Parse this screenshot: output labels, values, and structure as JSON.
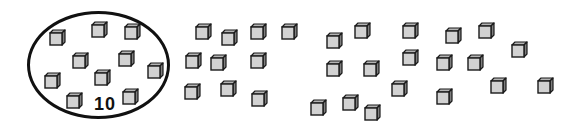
{
  "worksheet": {
    "group": {
      "label": "10",
      "ellipse": {
        "x": 27,
        "y": 11,
        "w": 143,
        "h": 108
      },
      "label_pos": {
        "x": 94,
        "y": 95
      },
      "cubes": [
        {
          "x": 49,
          "y": 29
        },
        {
          "x": 91,
          "y": 21
        },
        {
          "x": 124,
          "y": 23
        },
        {
          "x": 72,
          "y": 52
        },
        {
          "x": 118,
          "y": 50
        },
        {
          "x": 147,
          "y": 62
        },
        {
          "x": 44,
          "y": 72
        },
        {
          "x": 94,
          "y": 69
        },
        {
          "x": 66,
          "y": 92
        },
        {
          "x": 122,
          "y": 88
        }
      ]
    },
    "loose_cubes": [
      {
        "x": 195,
        "y": 23
      },
      {
        "x": 221,
        "y": 29
      },
      {
        "x": 250,
        "y": 23
      },
      {
        "x": 281,
        "y": 23
      },
      {
        "x": 185,
        "y": 52
      },
      {
        "x": 210,
        "y": 54
      },
      {
        "x": 250,
        "y": 52
      },
      {
        "x": 184,
        "y": 83
      },
      {
        "x": 220,
        "y": 80
      },
      {
        "x": 251,
        "y": 90
      },
      {
        "x": 326,
        "y": 32
      },
      {
        "x": 354,
        "y": 22
      },
      {
        "x": 402,
        "y": 22
      },
      {
        "x": 402,
        "y": 49
      },
      {
        "x": 326,
        "y": 60
      },
      {
        "x": 363,
        "y": 60
      },
      {
        "x": 391,
        "y": 80
      },
      {
        "x": 310,
        "y": 99
      },
      {
        "x": 342,
        "y": 94
      },
      {
        "x": 364,
        "y": 104
      },
      {
        "x": 445,
        "y": 27
      },
      {
        "x": 478,
        "y": 22
      },
      {
        "x": 511,
        "y": 41
      },
      {
        "x": 436,
        "y": 54
      },
      {
        "x": 467,
        "y": 54
      },
      {
        "x": 436,
        "y": 88
      },
      {
        "x": 490,
        "y": 77
      },
      {
        "x": 537,
        "y": 77
      }
    ],
    "counts": {
      "grouped": 10,
      "loose": 28,
      "total": 38
    },
    "colors": {
      "front": "#d2d2d2",
      "top": "#b4b4b4",
      "side": "#7e7e7e",
      "outline": "#1a1a1a"
    }
  }
}
